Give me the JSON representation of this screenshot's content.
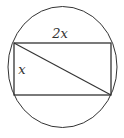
{
  "diagram": {
    "labels": {
      "top_side": "2x",
      "left_side": "x"
    },
    "colors": {
      "stroke": "#333333",
      "background": "#ffffff"
    },
    "shapes": {
      "circle": {
        "cx": 62.5,
        "cy": 67,
        "rx": 54.5,
        "ry": 60.5
      },
      "rectangle": {
        "x": 14,
        "y": 43,
        "width": 97,
        "height": 52
      },
      "diagonal": {
        "x1": 14,
        "y1": 43,
        "x2": 111,
        "y2": 95
      }
    }
  }
}
